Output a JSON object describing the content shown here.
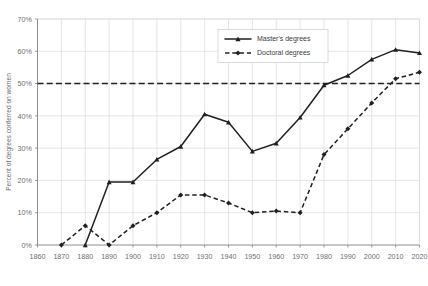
{
  "chart_data": {
    "type": "line",
    "title": "",
    "xlabel": "",
    "ylabel": "Percent of degrees conferred on women",
    "xlim": [
      1860,
      2020
    ],
    "ylim": [
      0,
      70
    ],
    "grid": true,
    "legend_position": "top-center-right",
    "x_ticks": [
      "1860",
      "1870",
      "1880",
      "1890",
      "1900",
      "1910",
      "1920",
      "1930",
      "1940",
      "1950",
      "1960",
      "1970",
      "1980",
      "1990",
      "2000",
      "2010",
      "2020"
    ],
    "y_ticks": [
      "0%",
      "10%",
      "20%",
      "30%",
      "40%",
      "50%",
      "60%",
      "70%"
    ],
    "reference_line": {
      "value": 50,
      "label": "50%",
      "style": "dashed"
    },
    "series": [
      {
        "name": "Master's degrees",
        "style": "solid",
        "marker": "triangle",
        "color": "#231f20",
        "x": [
          1880,
          1890,
          1900,
          1910,
          1920,
          1930,
          1940,
          1950,
          1960,
          1970,
          1980,
          1990,
          2000,
          2010,
          2020
        ],
        "values": [
          0,
          19.5,
          19.5,
          26.5,
          30.5,
          40.5,
          38,
          29,
          31.5,
          39.5,
          49.5,
          52.5,
          57.5,
          60.5,
          59.5
        ]
      },
      {
        "name": "Doctoral degrees",
        "style": "dashed",
        "marker": "diamond",
        "color": "#231f20",
        "x": [
          1870,
          1880,
          1890,
          1900,
          1910,
          1920,
          1930,
          1940,
          1950,
          1960,
          1970,
          1980,
          1990,
          2000,
          2010,
          2020
        ],
        "values": [
          0,
          6,
          0,
          6,
          10,
          15.5,
          15.5,
          13,
          10,
          10.5,
          10,
          28,
          36,
          44,
          51.5,
          53.5
        ]
      }
    ]
  },
  "legend": {
    "items": [
      {
        "label": "Master's degrees"
      },
      {
        "label": "Doctoral degrees"
      }
    ]
  }
}
